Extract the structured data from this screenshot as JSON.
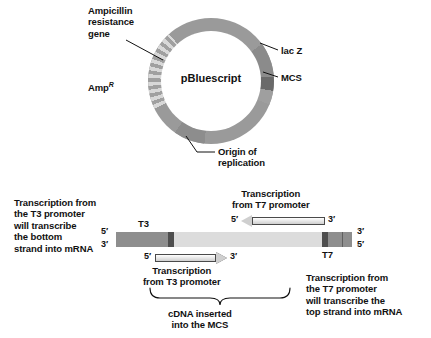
{
  "figure": {
    "plasmid": {
      "name": "pBluescript",
      "labels": {
        "amp_gene": "Ampicillin\nresistance\ngene",
        "amp_r": "Amp",
        "amp_r_sup": "R",
        "lacz": "lac Z",
        "mcs": "MCS",
        "origin": "Origin of\nreplication"
      },
      "colors": {
        "backbone": "#9a9a9a",
        "lacz": "#8b8b8b",
        "mcs": "#6a6a6a",
        "origin": "#8d8d8d",
        "amp_stripe_light": "#d8d8d8",
        "amp_stripe_dark": "#a0a0a0"
      }
    },
    "construct": {
      "left_caption": "Transcription from\nthe T3 promoter\nwill transcribe\nthe bottom\nstrand into mRNA",
      "top_caption": "Transcription\nfrom T7 promoter",
      "bottom_caption": "Transcription\nfrom T3 promoter",
      "right_caption": "Transcription from\nthe T7 promoter\nwill transcribe the\ntop strand into mRNA",
      "brace_caption": "cDNA inserted\ninto the MCS",
      "promoters": {
        "t3": "T3",
        "t7": "T7"
      },
      "strand_ends": {
        "left_top": "5′",
        "left_bottom": "3′",
        "right_top": "3′",
        "right_bottom": "5′"
      },
      "t7_arrow": {
        "from": "5′",
        "to": "3′",
        "direction": "leftward"
      },
      "t3_arrow": {
        "from": "5′",
        "to": "3′",
        "direction": "rightward"
      },
      "colors": {
        "backbone": "#9d9d9d",
        "insert": "#dcdcdc",
        "promoter_band": "#4e4e4e",
        "flank": "#8e8e8e"
      }
    }
  }
}
